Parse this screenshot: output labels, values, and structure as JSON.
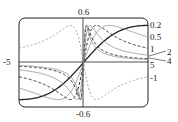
{
  "chart_data": {
    "type": "line",
    "title": "",
    "xlabel": "",
    "ylabel": "",
    "xlim": [
      -5,
      5
    ],
    "ylim": [
      -0.6,
      0.6
    ],
    "x_tick_labels": {
      "left": "-5"
    },
    "y_tick_labels": {
      "top": "0.6",
      "bottom": "-0.6"
    },
    "grid": false,
    "series": [
      {
        "name": "0.2",
        "c": 0.2,
        "style": "solid-dark"
      },
      {
        "name": "0.5",
        "c": 0.5,
        "style": "solid-gray"
      },
      {
        "name": "1",
        "c": 1,
        "style": "dashed-dark"
      },
      {
        "name": "2",
        "c": 2,
        "style": "solid-gray"
      },
      {
        "name": "4",
        "c": 4,
        "style": "dashed-dark"
      },
      {
        "name": "5",
        "c": 5,
        "style": "solid-gray"
      },
      {
        "name": "-1",
        "c": -1,
        "style": "dashed-gray"
      }
    ],
    "annotations": [
      "0.2",
      "0.5",
      "1",
      "2",
      "4",
      "5",
      "-1"
    ]
  },
  "labels": {
    "ytop": "0.6",
    "ybottom": "-0.6",
    "xleft": "-5",
    "c02": "0.2",
    "c05": "0.5",
    "c1": "1",
    "c2": "2",
    "c4": "4",
    "c5": "5",
    "cm1": "-1"
  }
}
